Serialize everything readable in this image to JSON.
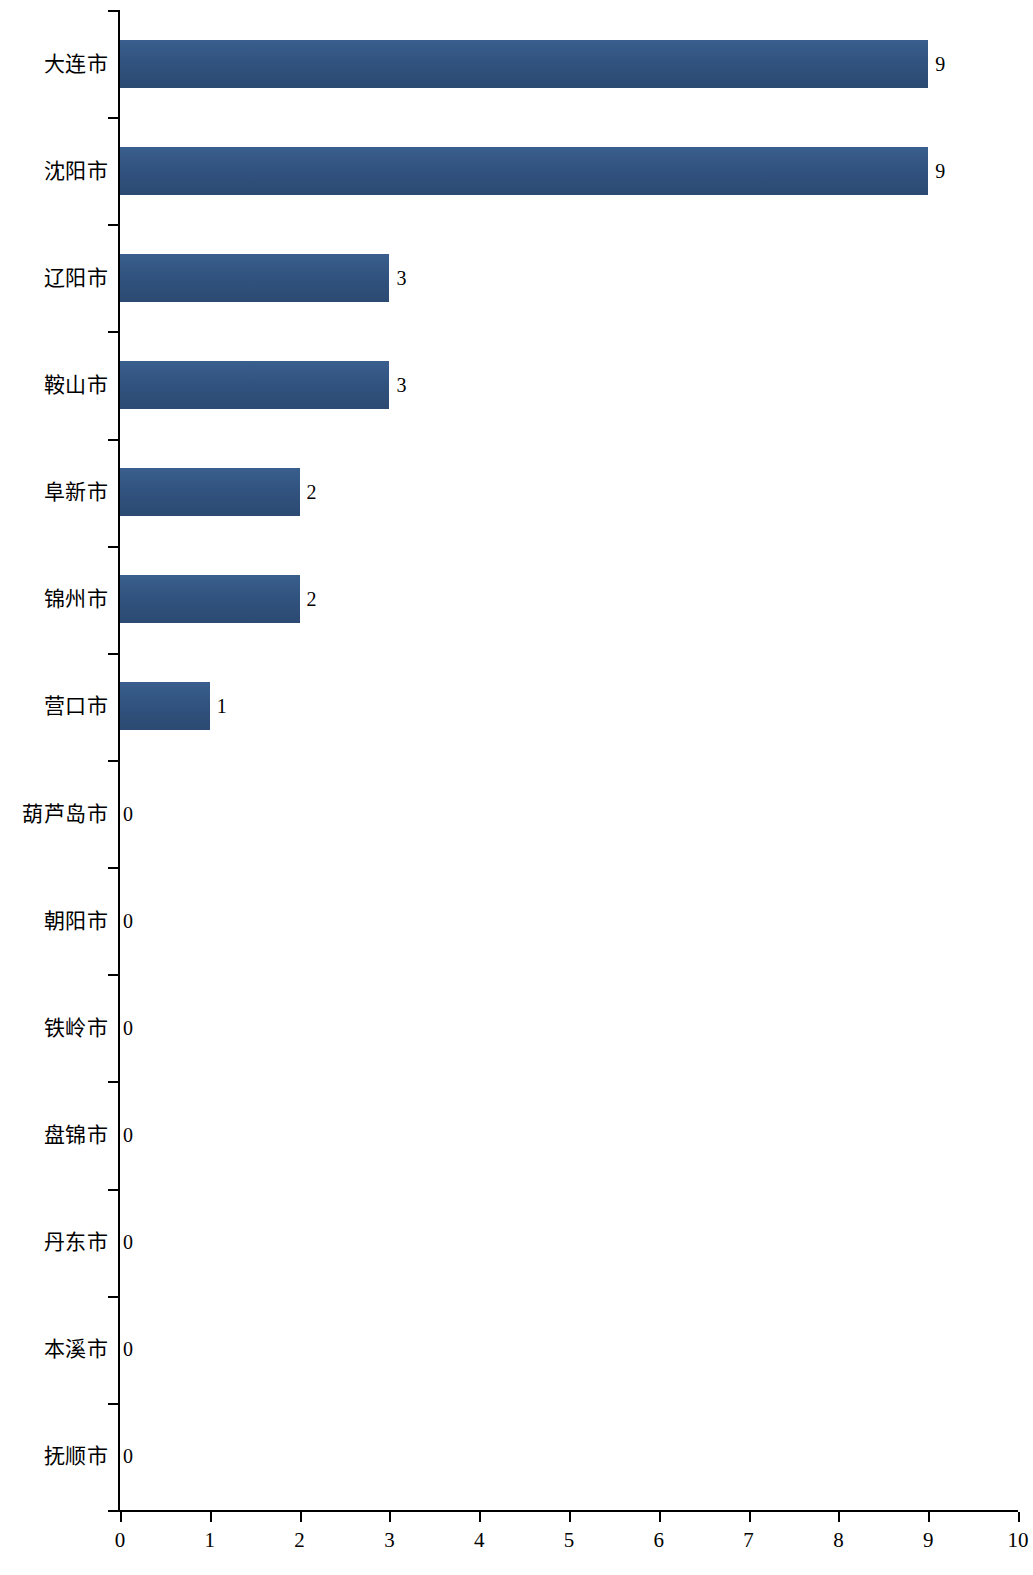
{
  "chart_data": {
    "type": "bar",
    "orientation": "horizontal",
    "title": "",
    "xlabel": "",
    "ylabel": "",
    "xlim": [
      0,
      10
    ],
    "xticks": [
      0,
      1,
      2,
      3,
      4,
      5,
      6,
      7,
      8,
      9,
      10
    ],
    "grid": false,
    "legend": null,
    "bar_color": "#31537f",
    "categories": [
      "大连市",
      "沈阳市",
      "辽阳市",
      "鞍山市",
      "阜新市",
      "锦州市",
      "营口市",
      "葫芦岛市",
      "朝阳市",
      "铁岭市",
      "盘锦市",
      "丹东市",
      "本溪市",
      "抚顺市"
    ],
    "values": [
      9,
      9,
      3,
      3,
      2,
      2,
      1,
      0,
      0,
      0,
      0,
      0,
      0,
      0
    ],
    "value_labels": [
      "9",
      "9",
      "3",
      "3",
      "2",
      "2",
      "1",
      "0",
      "0",
      "0",
      "0",
      "0",
      "0",
      "0"
    ]
  }
}
